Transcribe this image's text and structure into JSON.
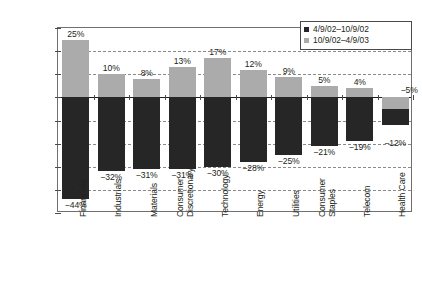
{
  "chart_data": {
    "type": "bar",
    "stacked": true,
    "title": "",
    "xlabel": "",
    "ylabel": "",
    "ylim": [
      -50,
      30
    ],
    "ytick_step": 10,
    "ytick_labels": [
      "30.0%",
      "20.0%",
      "10.0%",
      "0.0%",
      "-10.0%",
      "-20.0%",
      "-30.0%",
      "-40.0%",
      "-50.0%"
    ],
    "ytick_values": [
      30,
      20,
      10,
      0,
      -10,
      -20,
      -30,
      -40,
      -50
    ],
    "grid": true,
    "grid_axis": "y",
    "legend_position": "top-right",
    "categories": [
      "Financials",
      "Industrials",
      "Materials",
      "Consumer Discretionary",
      "Technology",
      "Energy",
      "Utilities",
      "Consumer Staples",
      "Telecom",
      "Health Care"
    ],
    "category_lines": [
      [
        "Financials"
      ],
      [
        "Industrials"
      ],
      [
        "Materials"
      ],
      [
        "Consumer",
        "Discretionary"
      ],
      [
        "Technology"
      ],
      [
        "Energy"
      ],
      [
        "Utilities"
      ],
      [
        "Consumer",
        "Staples"
      ],
      [
        "Telecom"
      ],
      [
        "Health Care"
      ]
    ],
    "series": [
      {
        "name": "4/9/02-10/9/02",
        "color": "#262626",
        "values": [
          -44,
          -32,
          -31,
          -31,
          -30,
          -28,
          -25,
          -21,
          -19,
          -12
        ],
        "labels": [
          "-44%",
          "-32%",
          "-31%",
          "-31%",
          "-30%",
          "-28%",
          "-25%",
          "-21%",
          "-19%",
          "-12%"
        ]
      },
      {
        "name": "10/9/02-4/9/03",
        "color": "#ababab",
        "values": [
          25,
          10,
          8,
          13,
          17,
          12,
          9,
          5,
          4,
          -5
        ],
        "labels": [
          "25%",
          "10%",
          "8%",
          "13%",
          "17%",
          "12%",
          "9%",
          "5%",
          "4%",
          "-5%"
        ]
      }
    ]
  },
  "legend": {
    "items": [
      {
        "label": "4/9/02–10/9/02",
        "swatch": "dark"
      },
      {
        "label": "10/9/02–4/9/03",
        "swatch": "light"
      }
    ]
  },
  "colors": {
    "series_dark": "#262626",
    "series_light": "#ababab",
    "axis": "#231f20",
    "grid": "#8a8a8a",
    "background": "#ffffff"
  }
}
